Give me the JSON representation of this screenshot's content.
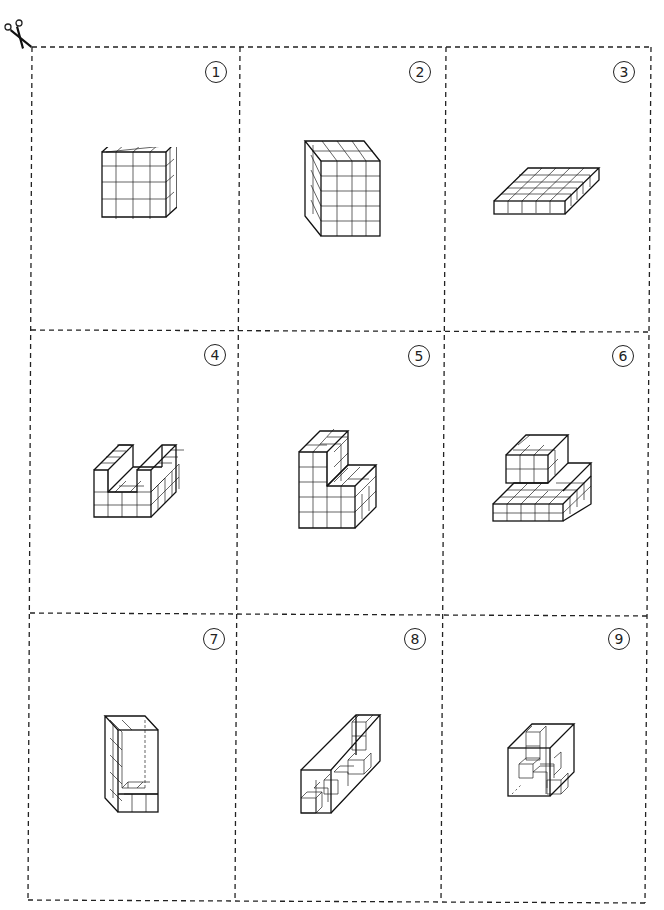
{
  "sheet": {
    "title": "Cube building cards - cut-out sheet",
    "line_color": "#222222",
    "cut_marker": "scissors-icon"
  },
  "cards": [
    {
      "number": "1",
      "description": "4x4x4 solid cube built from unit cubes",
      "shape": "cube-4x4x4"
    },
    {
      "number": "2",
      "description": "tall cuboid 4 wide, 5 high, 2 deep",
      "shape": "cuboid-tall"
    },
    {
      "number": "3",
      "description": "flat slab 5 wide, 1 high, 5 deep",
      "shape": "slab"
    },
    {
      "number": "4",
      "description": "U-shaped block with a channel cut into the top",
      "shape": "u-block"
    },
    {
      "number": "5",
      "description": "L-shaped step block, tall left tower with lower right step",
      "shape": "l-step"
    },
    {
      "number": "6",
      "description": "two-tier block, small cube on top of wide base",
      "shape": "two-tier"
    },
    {
      "number": "7",
      "description": "transparent box with cubes lining back wall and floor",
      "shape": "open-box-l"
    },
    {
      "number": "8",
      "description": "long transparent prism containing a staircase of cubes",
      "shape": "long-prism"
    },
    {
      "number": "9",
      "description": "transparent box containing a tower and floor cubes",
      "shape": "box-tower"
    }
  ]
}
